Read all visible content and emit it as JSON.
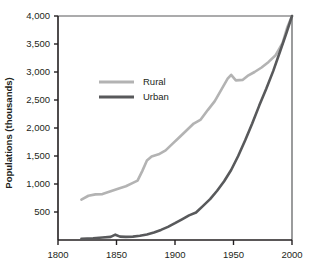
{
  "chart_data": {
    "type": "line",
    "title": "",
    "subtitle": "",
    "xlabel": "",
    "ylabel": "Populations (thousands)",
    "xlim": [
      1800,
      2000
    ],
    "ylim": [
      0,
      4000
    ],
    "xticks": [
      1800,
      1850,
      1900,
      1950,
      2000
    ],
    "xtick_labels": [
      "1800",
      "1850",
      "1900",
      "1950",
      "2000"
    ],
    "yticks": [
      500,
      1000,
      1500,
      2000,
      2500,
      3000,
      3500,
      4000
    ],
    "ytick_labels": [
      "500",
      "1,000",
      "1,500",
      "2,000",
      "2,500",
      "3,000",
      "3,500",
      "4,000"
    ],
    "grid": false,
    "legend_position": "upper-left-inside",
    "series": [
      {
        "name": "Rural",
        "color": "#b3b3b3",
        "x": [
          1820,
          1826,
          1832,
          1838,
          1845,
          1852,
          1858,
          1864,
          1868,
          1872,
          1876,
          1880,
          1886,
          1892,
          1898,
          1904,
          1910,
          1916,
          1922,
          1928,
          1934,
          1940,
          1945,
          1948,
          1952,
          1958,
          1962,
          1968,
          1974,
          1980,
          1986,
          1992,
          1996,
          2000
        ],
        "y": [
          720,
          790,
          815,
          820,
          870,
          920,
          960,
          1020,
          1060,
          1230,
          1420,
          1490,
          1530,
          1600,
          1720,
          1840,
          1960,
          2080,
          2150,
          2320,
          2480,
          2700,
          2880,
          2950,
          2850,
          2860,
          2930,
          3000,
          3080,
          3180,
          3300,
          3520,
          3800,
          4000
        ]
      },
      {
        "name": "Urban",
        "color": "#58595b",
        "x": [
          1820,
          1830,
          1838,
          1845,
          1849,
          1853,
          1858,
          1864,
          1870,
          1876,
          1882,
          1888,
          1894,
          1900,
          1906,
          1912,
          1918,
          1924,
          1930,
          1936,
          1942,
          1948,
          1954,
          1960,
          1966,
          1972,
          1978,
          1984,
          1990,
          1995,
          2000
        ],
        "y": [
          20,
          30,
          45,
          55,
          95,
          60,
          55,
          60,
          75,
          100,
          135,
          180,
          235,
          300,
          370,
          440,
          490,
          610,
          730,
          880,
          1050,
          1250,
          1500,
          1780,
          2080,
          2400,
          2700,
          3020,
          3380,
          3680,
          4000
        ]
      }
    ]
  },
  "legend": {
    "entries": [
      {
        "label": "Rural",
        "color": "#b3b3b3"
      },
      {
        "label": "Urban",
        "color": "#58595b"
      }
    ]
  },
  "axes": {
    "y_title": "Populations (thousands)"
  },
  "colors": {
    "rural": "#b3b3b3",
    "urban": "#58595b",
    "axis": "#231f20",
    "background": "#ffffff"
  }
}
